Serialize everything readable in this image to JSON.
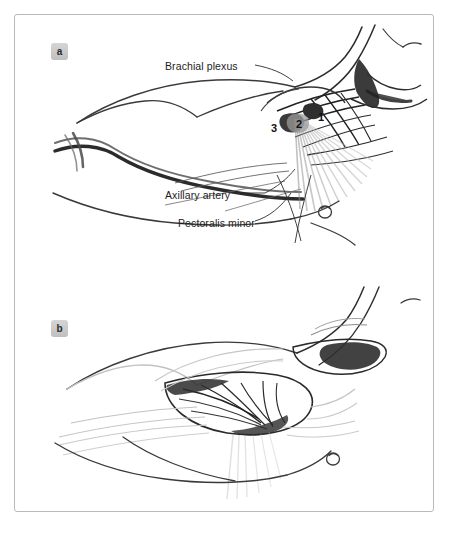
{
  "figure": {
    "panels": [
      {
        "id": "a",
        "badge": "a"
      },
      {
        "id": "b",
        "badge": "b"
      }
    ],
    "labels": {
      "brachial_plexus": "Brachial plexus",
      "axillary_artery": "Axillary artery",
      "pectoralis_minor": "Pectoralis minor"
    },
    "part_numbers": {
      "one": "1",
      "two": "2",
      "three": "3"
    },
    "colors": {
      "border": "#b9b9bb",
      "badge_background": "#c9c9c9",
      "badge_text": "#2b2b2b",
      "label_text": "#1d1d1d",
      "ink_dark": "#1a1a1a",
      "ink_mid": "#4d4d4d",
      "ink_faint": "#c6c6c8",
      "page_background": "#ffffff"
    }
  }
}
